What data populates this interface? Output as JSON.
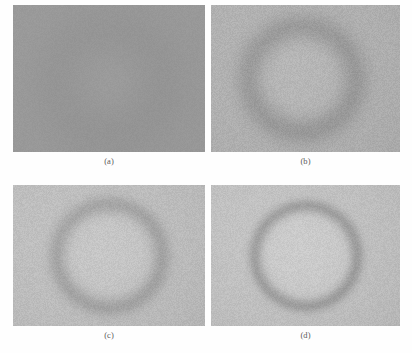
{
  "figure": {
    "kind": "multi-panel-grayscale-image-figure",
    "background_color": "#fefefe",
    "width": 412,
    "height": 353,
    "columns": 2,
    "rows": 2,
    "caption_color": "#5a5a5a",
    "panels": [
      {
        "id": "a",
        "caption": "(a)",
        "description": "near-uniform medium gray field with a very faint broad circular blob, heaviest blur / lowest contrast",
        "x": 13,
        "y": 5,
        "width": 192,
        "height": 147,
        "base_gray": "#9b9b9b",
        "background_gray": 155,
        "ring_center_x": 0.5,
        "ring_center_y": 0.52,
        "ring_radius": 0.33,
        "ring_thickness": 0.3,
        "ring_darkness": 7,
        "interior_brightness": 2,
        "blur": 9.0,
        "noise": 3,
        "vignette": 4
      },
      {
        "id": "b",
        "caption": "(b)",
        "description": "lighter gray field with a visible dark circular ring outline, moderate blur, grainy texture",
        "x": 211,
        "y": 5,
        "width": 189,
        "height": 147,
        "base_gray": "#b2b2b2",
        "background_gray": 178,
        "ring_center_x": 0.48,
        "ring_center_y": 0.5,
        "ring_radius": 0.36,
        "ring_thickness": 0.13,
        "ring_darkness": 26,
        "interior_brightness": 4,
        "blur": 3.2,
        "noise": 7,
        "vignette": 10
      },
      {
        "id": "c",
        "caption": "(c)",
        "description": "light gray field, brighter disc interior bounded by a soft dark ring, sharper than (b)",
        "x": 13,
        "y": 185,
        "width": 192,
        "height": 141,
        "base_gray": "#bfbfbf",
        "background_gray": 191,
        "ring_center_x": 0.5,
        "ring_center_y": 0.5,
        "ring_radius": 0.37,
        "ring_thickness": 0.09,
        "ring_darkness": 30,
        "interior_brightness": 7,
        "blur": 2.0,
        "noise": 7,
        "vignette": 12
      },
      {
        "id": "d",
        "caption": "(d)",
        "description": "light gray field with the sharpest, darkest circular ring edge and brightest interior, least blur",
        "x": 211,
        "y": 185,
        "width": 189,
        "height": 141,
        "base_gray": "#c2c2c2",
        "background_gray": 194,
        "ring_center_x": 0.5,
        "ring_center_y": 0.5,
        "ring_radius": 0.36,
        "ring_thickness": 0.07,
        "ring_darkness": 38,
        "interior_brightness": 9,
        "blur": 1.3,
        "noise": 7,
        "vignette": 13
      }
    ]
  }
}
